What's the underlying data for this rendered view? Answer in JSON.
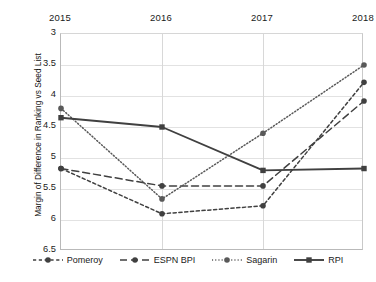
{
  "chart_data": {
    "type": "line",
    "title": "",
    "xlabel": "",
    "ylabel": "Margin of Difference in Ranking vs Seed List",
    "categories": [
      "2015",
      "2016",
      "2017",
      "2018"
    ],
    "xtick_labels": [
      "2015",
      "2016",
      "2017",
      "2018"
    ],
    "ytick_labels": [
      "3",
      "3.5",
      "4",
      "4.5",
      "5",
      "5.5",
      "6",
      "6.5"
    ],
    "ytick_values": [
      3,
      3.5,
      4,
      4.5,
      5,
      5.5,
      6,
      6.5
    ],
    "ylim": [
      3,
      6.5
    ],
    "y_axis_inverted": true,
    "grid": "horizontal-and-vertical",
    "legend_position": "bottom",
    "xaxis_labels_position": "top",
    "series": [
      {
        "name": "Pomeroy",
        "line_style": "dashed-fine",
        "marker": "circle",
        "color": "#404040",
        "values": [
          5.17,
          5.9,
          5.77,
          3.78
        ]
      },
      {
        "name": "ESPN BPI",
        "line_style": "dashed-long",
        "marker": "circle",
        "color": "#404040",
        "values": [
          5.17,
          5.45,
          5.45,
          4.08
        ]
      },
      {
        "name": "Sagarin",
        "line_style": "dotted",
        "marker": "circle",
        "color": "#595959",
        "values": [
          4.2,
          5.66,
          4.6,
          3.5
        ]
      },
      {
        "name": "RPI",
        "line_style": "solid",
        "marker": "square",
        "color": "#404040",
        "values": [
          4.35,
          4.5,
          5.2,
          5.17
        ]
      }
    ]
  },
  "legend": {
    "items": [
      {
        "label": "Pomeroy"
      },
      {
        "label": "ESPN BPI"
      },
      {
        "label": "Sagarin"
      },
      {
        "label": "RPI"
      }
    ]
  }
}
